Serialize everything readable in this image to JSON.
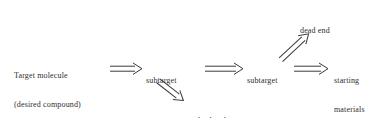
{
  "diagram": {
    "background_color": "#ffffff",
    "ink_color": "#2e2e2e",
    "width": 391,
    "height": 118,
    "nodes": [
      {
        "id": "target-molecule",
        "lines": [
          "Target molecule",
          "(desired compound)"
        ],
        "x": 14,
        "y": 52,
        "align": "left"
      },
      {
        "id": "subtarget-1",
        "lines": [
          "subtarget"
        ],
        "x": 146,
        "y": 57,
        "align": "left"
      },
      {
        "id": "subtarget-2",
        "lines": [
          "subtarget"
        ],
        "x": 247,
        "y": 57,
        "align": "left"
      },
      {
        "id": "starting-materials",
        "lines": [
          "starting",
          "materials"
        ],
        "x": 334,
        "y": 57,
        "align": "left"
      },
      {
        "id": "dead-end-top",
        "lines": [
          "dead end"
        ],
        "x": 300,
        "y": 7,
        "align": "left"
      },
      {
        "id": "dead-end-bottom",
        "lines": [
          "dead end"
        ],
        "x": 196,
        "y": 97,
        "align": "left"
      }
    ],
    "arrows": [
      {
        "id": "arrow-target-to-subtarget-1",
        "type": "retrosynthetic-double-arrow",
        "from": "target-molecule",
        "to": "subtarget-1",
        "x": 110,
        "y": 63,
        "length": 32,
        "angle_deg": 0
      },
      {
        "id": "arrow-subtarget-1-to-subtarget-2",
        "type": "retrosynthetic-double-arrow",
        "from": "subtarget-1",
        "to": "subtarget-2",
        "x": 205,
        "y": 63,
        "length": 38,
        "angle_deg": 0
      },
      {
        "id": "arrow-subtarget-2-to-starting-materials",
        "type": "retrosynthetic-double-arrow",
        "from": "subtarget-2",
        "to": "starting-materials",
        "x": 294,
        "y": 63,
        "length": 34,
        "angle_deg": 0
      },
      {
        "id": "arrow-subtarget-1-to-dead-end-bottom",
        "type": "retrosynthetic-double-arrow",
        "from": "subtarget-1",
        "to": "dead-end-bottom",
        "x": 158,
        "y": 75,
        "length": 32,
        "angle_deg": 38
      },
      {
        "id": "arrow-to-dead-end-top",
        "type": "retrosynthetic-double-arrow",
        "from": "subtarget-2",
        "to": "dead-end-top",
        "x": 281,
        "y": 54,
        "length": 38,
        "angle_deg": -43
      }
    ]
  }
}
